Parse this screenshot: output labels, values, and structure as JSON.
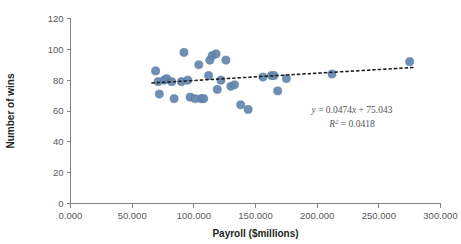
{
  "chart_data": {
    "type": "scatter",
    "title": "",
    "xlabel": "Payroll ($millions)",
    "ylabel": "Number of wins",
    "xlim": [
      0,
      300
    ],
    "ylim": [
      0,
      120
    ],
    "xticks": [
      "0.000",
      "50.000",
      "100.000",
      "150.000",
      "200.000",
      "250.000",
      "300.000"
    ],
    "xtick_values": [
      0,
      50,
      100,
      150,
      200,
      250,
      300
    ],
    "yticks": [
      "0",
      "20",
      "40",
      "60",
      "80",
      "100",
      "120"
    ],
    "ytick_values": [
      0,
      20,
      40,
      60,
      80,
      100,
      120
    ],
    "grid": false,
    "legend": "none",
    "marker_color": "#6387ad",
    "trendline_color": "#231f20",
    "points": [
      {
        "x": 69,
        "y": 86
      },
      {
        "x": 71,
        "y": 79
      },
      {
        "x": 72,
        "y": 71
      },
      {
        "x": 76,
        "y": 80
      },
      {
        "x": 78,
        "y": 81
      },
      {
        "x": 82,
        "y": 79
      },
      {
        "x": 84,
        "y": 68
      },
      {
        "x": 90,
        "y": 79
      },
      {
        "x": 92,
        "y": 98
      },
      {
        "x": 95,
        "y": 80
      },
      {
        "x": 97,
        "y": 69
      },
      {
        "x": 101,
        "y": 68
      },
      {
        "x": 104,
        "y": 90
      },
      {
        "x": 106,
        "y": 68
      },
      {
        "x": 108,
        "y": 68
      },
      {
        "x": 112,
        "y": 83
      },
      {
        "x": 113,
        "y": 93
      },
      {
        "x": 115,
        "y": 96
      },
      {
        "x": 118,
        "y": 97
      },
      {
        "x": 119,
        "y": 74
      },
      {
        "x": 122,
        "y": 80
      },
      {
        "x": 126,
        "y": 93
      },
      {
        "x": 130,
        "y": 76
      },
      {
        "x": 133,
        "y": 77
      },
      {
        "x": 138,
        "y": 64
      },
      {
        "x": 144,
        "y": 61
      },
      {
        "x": 156,
        "y": 82
      },
      {
        "x": 163,
        "y": 83
      },
      {
        "x": 165,
        "y": 83
      },
      {
        "x": 168,
        "y": 73
      },
      {
        "x": 175,
        "y": 81
      },
      {
        "x": 212,
        "y": 84
      },
      {
        "x": 275,
        "y": 92
      }
    ],
    "trendline": {
      "slope": 0.0474,
      "intercept": 75.043,
      "x_start": 66,
      "x_end": 279,
      "equation": "= 0.0474  + 75.043",
      "equation_lhs": "y",
      "equation_mid": "x",
      "r_squared_label": "R",
      "r_squared_sup": "2",
      "r_squared_value": "= 0.0418"
    }
  }
}
